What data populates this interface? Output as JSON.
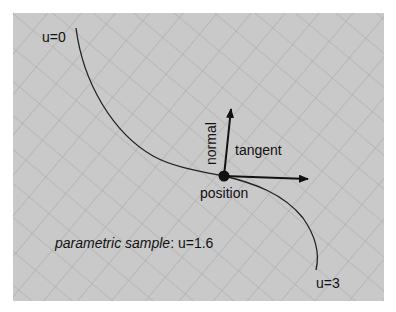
{
  "diagram": {
    "type": "parametric-curve-frame",
    "labels": {
      "start": "u=0",
      "end": "u=3",
      "normal": "normal",
      "tangent": "tangent",
      "position": "position",
      "caption_italic": "parametric sample",
      "caption_value": ": u=1.6"
    },
    "colors": {
      "background": "#c9c9c9",
      "grid": "#a8a8a8",
      "curve": "#222222",
      "arrow": "#111111"
    }
  }
}
